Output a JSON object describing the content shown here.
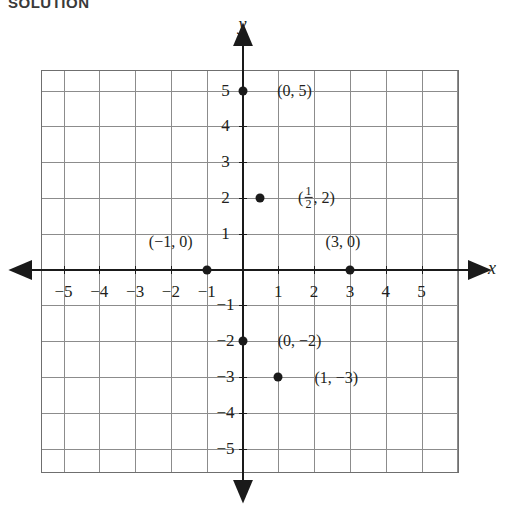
{
  "heading": "SOLUTION",
  "axes": {
    "x_label": "x",
    "y_label": "y"
  },
  "chart_data": {
    "type": "scatter",
    "title": "",
    "xlabel": "x",
    "ylabel": "y",
    "xlim": [
      -6,
      6
    ],
    "ylim": [
      -6,
      6
    ],
    "grid": true,
    "legend": "none",
    "x_ticks": [
      -5,
      -4,
      -3,
      -2,
      -1,
      1,
      2,
      3,
      4,
      5
    ],
    "y_ticks": [
      5,
      4,
      3,
      2,
      1,
      -1,
      -2,
      -3,
      -4,
      -5
    ],
    "x_tick_labels": [
      "−5",
      "−4",
      "−3",
      "−2",
      "−1",
      "1",
      "2",
      "3",
      "4",
      "5"
    ],
    "y_tick_labels": [
      "5",
      "4",
      "3",
      "2",
      "1",
      "−1",
      "−2",
      "−3",
      "−4",
      "−5"
    ],
    "points": [
      {
        "x": 0,
        "y": 5,
        "label": "(0, 5)",
        "label_dx": 52,
        "label_dy": 0,
        "fraction": false
      },
      {
        "x": 0.5,
        "y": 2,
        "label": "(½, 2)",
        "label_dx": 56,
        "label_dy": 1,
        "fraction": true,
        "num": "1",
        "den": "2",
        "prefix": "(",
        "suffix": ", 2)"
      },
      {
        "x": -1,
        "y": 0,
        "label": "(−1, 0)",
        "label_dx": -36,
        "label_dy": -28,
        "fraction": false
      },
      {
        "x": 3,
        "y": 0,
        "label": "(3, 0)",
        "label_dx": -7,
        "label_dy": -28,
        "fraction": false
      },
      {
        "x": 0,
        "y": -2,
        "label": "(0, −2)",
        "label_dx": 57,
        "label_dy": 0,
        "fraction": false
      },
      {
        "x": 1,
        "y": -3,
        "label": "(1, −3)",
        "label_dx": 58,
        "label_dy": 1,
        "fraction": false
      }
    ]
  },
  "colors": {
    "ink": "#231f20",
    "grid": "#8c8c8c",
    "axis": "#1a1a1a",
    "point": "#1a1a1a"
  }
}
